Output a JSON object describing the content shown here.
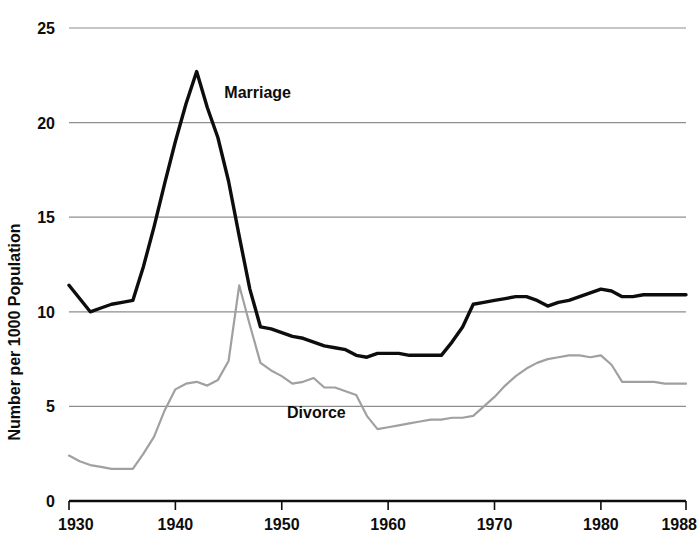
{
  "chart_data": {
    "type": "line",
    "title": "",
    "subtitle": "",
    "xlabel": "",
    "ylabel": "Number per 1000 Population",
    "xlim": [
      1930,
      1988
    ],
    "ylim": [
      0,
      25
    ],
    "grid": true,
    "grid_axis": "y",
    "legend_position": "inline-annotation",
    "x_ticks": [
      1930,
      1940,
      1950,
      1960,
      1970,
      1980,
      1988
    ],
    "x_tick_labels": [
      "1930",
      "1940",
      "1950",
      "1960",
      "1970",
      "1980",
      "1988"
    ],
    "y_ticks": [
      0,
      5,
      10,
      15,
      20,
      25
    ],
    "y_tick_labels": [
      "0",
      "5",
      "10",
      "15",
      "20",
      "25"
    ],
    "annotations": [
      {
        "text": "Marriage",
        "x": 1944.6,
        "y": 21.3
      },
      {
        "text": "Divorce",
        "x": 1950.5,
        "y": 4.4
      }
    ],
    "series": [
      {
        "name": "Marriage",
        "color": "#0d0d0d",
        "line_width": 3.4,
        "x": [
          1930,
          1931,
          1932,
          1933,
          1934,
          1935,
          1936,
          1937,
          1938,
          1939,
          1940,
          1941,
          1942,
          1943,
          1944,
          1945,
          1946,
          1947,
          1948,
          1949,
          1950,
          1951,
          1952,
          1953,
          1954,
          1955,
          1956,
          1957,
          1958,
          1959,
          1960,
          1961,
          1962,
          1963,
          1964,
          1965,
          1966,
          1967,
          1968,
          1969,
          1970,
          1971,
          1972,
          1973,
          1974,
          1975,
          1976,
          1977,
          1978,
          1979,
          1980,
          1981,
          1982,
          1983,
          1984,
          1985,
          1986,
          1987,
          1988
        ],
        "y": [
          11.4,
          10.7,
          10.0,
          10.2,
          10.4,
          10.5,
          10.6,
          12.4,
          14.5,
          16.8,
          19.0,
          21.0,
          22.7,
          20.8,
          19.2,
          16.9,
          14.0,
          11.2,
          9.2,
          9.1,
          8.9,
          8.7,
          8.6,
          8.4,
          8.2,
          8.1,
          8.0,
          7.7,
          7.6,
          7.8,
          7.8,
          7.8,
          7.7,
          7.7,
          7.7,
          7.7,
          8.4,
          9.2,
          10.4,
          10.5,
          10.6,
          10.7,
          10.8,
          10.8,
          10.6,
          10.3,
          10.5,
          10.6,
          10.8,
          11.0,
          11.2,
          11.1,
          10.8,
          10.8,
          10.9,
          10.9,
          10.9,
          10.9,
          10.9
        ]
      },
      {
        "name": "Divorce",
        "color": "#a0a0a0",
        "line_width": 2.2,
        "x": [
          1930,
          1931,
          1932,
          1933,
          1934,
          1935,
          1936,
          1937,
          1938,
          1939,
          1940,
          1941,
          1942,
          1943,
          1944,
          1945,
          1946,
          1947,
          1948,
          1949,
          1950,
          1951,
          1952,
          1953,
          1954,
          1955,
          1956,
          1957,
          1958,
          1959,
          1960,
          1961,
          1962,
          1963,
          1964,
          1965,
          1966,
          1967,
          1968,
          1969,
          1970,
          1971,
          1972,
          1973,
          1974,
          1975,
          1976,
          1977,
          1978,
          1979,
          1980,
          1981,
          1982,
          1983,
          1984,
          1985,
          1986,
          1987,
          1988
        ],
        "y": [
          2.4,
          2.1,
          1.9,
          1.8,
          1.7,
          1.7,
          1.7,
          2.5,
          3.4,
          4.8,
          5.9,
          6.2,
          6.3,
          6.1,
          6.4,
          7.4,
          11.4,
          9.3,
          7.3,
          6.9,
          6.6,
          6.2,
          6.3,
          6.5,
          6.0,
          6.0,
          5.8,
          5.6,
          4.5,
          3.8,
          3.9,
          4.0,
          4.1,
          4.2,
          4.3,
          4.3,
          4.4,
          4.4,
          4.5,
          5.0,
          5.5,
          6.1,
          6.6,
          7.0,
          7.3,
          7.5,
          7.6,
          7.7,
          7.7,
          7.6,
          7.7,
          7.2,
          6.3,
          6.3,
          6.3,
          6.3,
          6.2,
          6.2,
          6.2
        ]
      }
    ]
  },
  "plot_geometry": {
    "left": 69,
    "right": 686,
    "top": 28,
    "bottom": 501
  }
}
